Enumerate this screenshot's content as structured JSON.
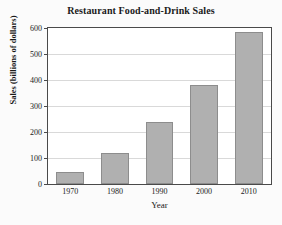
{
  "chart_data": {
    "type": "bar",
    "title": "Restaurant Food-and-Drink Sales",
    "xlabel": "Year",
    "ylabel": "Sales (billions of dollars)",
    "categories": [
      "1970",
      "1980",
      "1990",
      "2000",
      "2010"
    ],
    "values": [
      45,
      120,
      240,
      380,
      583
    ],
    "ylim": [
      0,
      600
    ],
    "yticks": [
      "0",
      "100",
      "200",
      "300",
      "400",
      "500",
      "600"
    ],
    "ytick_values": [
      0,
      100,
      200,
      300,
      400,
      500,
      600
    ],
    "grid": true,
    "legend": false,
    "bar_color": "#b0b0b0",
    "bar_edge_color": "#8d8d8d",
    "frame_color": "#4a4a4a",
    "grid_color": "#d9d9d9",
    "background": "#fbfbfb",
    "plot_background": "#ffffff"
  }
}
